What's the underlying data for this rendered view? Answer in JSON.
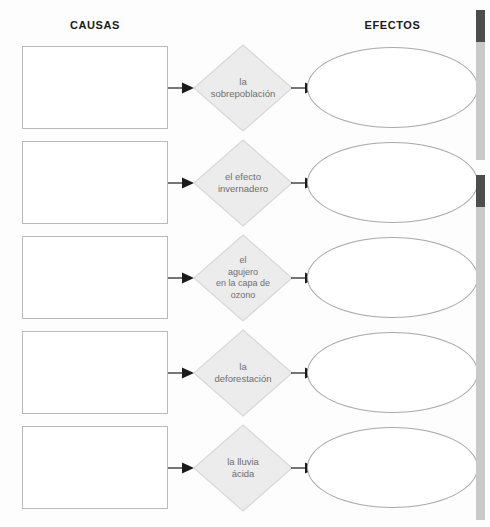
{
  "worksheet": {
    "headings": {
      "causes": "CAUSAS",
      "effects": "EFECTOS"
    },
    "colors": {
      "page_background": "#fdfdfd",
      "diamond_fill": "#ececec",
      "diamond_border": "#d8d8d8",
      "diamond_text": "#6e6e6e",
      "box_border": "#b9b9b9",
      "ellipse_border": "#a9a9a9",
      "heading_text": "#1b1b1b",
      "arrow": "#1b1b1b",
      "scan_edge_light": "#c9c9c9",
      "scan_edge_dark": "#4d4d4d"
    },
    "rows": [
      {
        "topic": "la sobrepoblación",
        "topic_lines": "la\nsobrepoblación",
        "cause_value": "",
        "effect_value": "",
        "arrow_in": "arrow-right-glyph",
        "arrow_out": "arrow-right-glyph"
      },
      {
        "topic": "el efecto invernadero",
        "topic_lines": "el efecto\ninvernadero",
        "cause_value": "",
        "effect_value": "",
        "arrow_in": "arrow-right-glyph",
        "arrow_out": "arrow-right-glyph"
      },
      {
        "topic": "el agujero en la capa de ozono",
        "topic_lines": "el\nagujero\nen la capa de\nozono",
        "cause_value": "",
        "effect_value": "",
        "arrow_in": "arrow-right-glyph",
        "arrow_out": "arrow-right-glyph"
      },
      {
        "topic": "la deforestación",
        "topic_lines": "la\ndeforestación",
        "cause_value": "",
        "effect_value": "",
        "arrow_in": "arrow-right-glyph",
        "arrow_out": "arrow-right-glyph"
      },
      {
        "topic": "la lluvia ácida",
        "topic_lines": "la lluvia\nácida",
        "cause_value": "",
        "effect_value": "",
        "arrow_in": "arrow-right-glyph",
        "arrow_out": "arrow-right-glyph"
      }
    ]
  }
}
